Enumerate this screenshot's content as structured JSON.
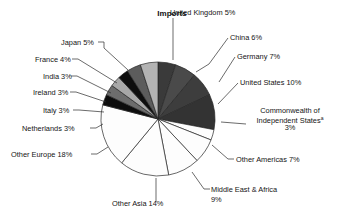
{
  "chart_data": {
    "type": "pie",
    "title": "Imports",
    "xlabel": "",
    "ylabel": "",
    "legend_position": "none",
    "grid": false,
    "value_unit": "percent",
    "total": 100,
    "footnote_marker": "a",
    "categories": [
      "United Kingdom",
      "China",
      "Germany",
      "United States",
      "Commonwealth of Independent States",
      "Other Americas",
      "Middle East & Africa",
      "Other Asia",
      "Other Europe",
      "Netherlands",
      "Italy",
      "Ireland",
      "India",
      "France",
      "Japan"
    ],
    "values": [
      5,
      6,
      7,
      10,
      3,
      7,
      9,
      14,
      18,
      3,
      3,
      3,
      3,
      4,
      5
    ],
    "slices": [
      {
        "name": "united-kingdom",
        "label": "United Kingdom 5%",
        "category": "United Kingdom",
        "value": 5,
        "color": "#3a3a3a",
        "label_x": 170,
        "label_y": 15,
        "label_anchor": "start",
        "leader": "M 173,18 L 173,60"
      },
      {
        "name": "china",
        "label": "China 6%",
        "category": "China",
        "value": 6,
        "color": "#4a4a4a",
        "label_x": 230,
        "label_y": 40,
        "label_anchor": "start",
        "leader": "M 228,38 L 209,64 L 196,72"
      },
      {
        "name": "germany",
        "label": "Germany 7%",
        "category": "Germany",
        "value": 7,
        "color": "#3d3d3d",
        "label_x": 237,
        "label_y": 59,
        "label_anchor": "start",
        "leader": "M 235,57 L 219,82"
      },
      {
        "name": "united-states",
        "label": "United States 10%",
        "category": "United States",
        "value": 10,
        "color": "#333333",
        "label_x": 240,
        "label_y": 85,
        "label_anchor": "start",
        "leader": "M 238,83 L 218,104"
      },
      {
        "name": "commonwealth-of-independent-states",
        "label_line1": "Commonwealth of",
        "label_line2": "Independent States",
        "label_line3": "3%",
        "label": "Commonwealth of Independent Statesᵃ 3%",
        "category": "Commonwealth of Independent States",
        "value": 3,
        "color": "#fdfdfd",
        "label_x": 290,
        "label_y": 113,
        "label_anchor": "middle",
        "leader": "M 246,124 L 221,122"
      },
      {
        "name": "other-americas",
        "label": "Other Americas 7%",
        "category": "Other Americas",
        "value": 7,
        "color": "#fdfdfd",
        "label_x": 236,
        "label_y": 162,
        "label_anchor": "start",
        "leader": "M 234,159 L 228,159 L 212,145"
      },
      {
        "name": "middle-east-africa",
        "label_line1": "Middle East & Africa",
        "label_line2": "9%",
        "label": "Middle East & Africa 9%",
        "category": "Middle East & Africa",
        "value": 9,
        "color": "#fdfdfd",
        "label_x": 211,
        "label_y": 192,
        "label_anchor": "start",
        "leader": "M 210,189 L 204,189 L 192,172"
      },
      {
        "name": "other-asia",
        "label": "Other Asia 14%",
        "category": "Other Asia",
        "value": 14,
        "color": "#fdfdfd",
        "label_x": 112,
        "label_y": 206,
        "label_anchor": "start",
        "leader": "M 156,202 L 156,178"
      },
      {
        "name": "other-europe",
        "label": "Other Europe 18%",
        "category": "Other Europe",
        "value": 18,
        "color": "#fdfdfd",
        "label_x": 11,
        "label_y": 157,
        "label_anchor": "start",
        "leader": "M 91,154 L 97,154 L 108,147"
      },
      {
        "name": "netherlands",
        "label": "Netherlands 3%",
        "category": "Netherlands",
        "value": 3,
        "color": "#0d0d0d",
        "label_x": 22,
        "label_y": 131,
        "label_anchor": "start",
        "leader": "M 90,128 L 96,128 L 103,124"
      },
      {
        "name": "italy",
        "label": "Italy 3%",
        "category": "Italy",
        "value": 3,
        "color": "#6d6d6d",
        "label_x": 43,
        "label_y": 113,
        "label_anchor": "start",
        "leader": "M 73,110 L 79,110 L 104,112"
      },
      {
        "name": "ireland",
        "label": "Ireland 3%",
        "category": "Ireland",
        "value": 3,
        "color": "#a8a8a8",
        "label_x": 33,
        "label_y": 95,
        "label_anchor": "start",
        "leader": "M 70,92 L 76,92 L 106,102"
      },
      {
        "name": "india",
        "label": "India 3%",
        "category": "India",
        "value": 3,
        "color": "#0d0d0d",
        "label_x": 43,
        "label_y": 79,
        "label_anchor": "start",
        "leader": "M 71,76 L 77,76 L 111,93"
      },
      {
        "name": "france",
        "label": "France 4%",
        "category": "France",
        "value": 4,
        "color": "#5c5c5c",
        "label_x": 35,
        "label_y": 62,
        "label_anchor": "start",
        "leader": "M 72,59 L 78,59 L 117,83"
      },
      {
        "name": "japan",
        "label": "Japan 5%",
        "category": "Japan",
        "value": 5,
        "color": "#b3b3b3",
        "label_x": 61,
        "label_y": 45,
        "label_anchor": "start",
        "leader": "M 98,42 L 104,42 L 104,48 L 128,70"
      }
    ],
    "geometry": {
      "center_x": 158,
      "center_y": 119,
      "radius": 57,
      "start_angle_deg": -90,
      "direction": "clockwise"
    }
  }
}
